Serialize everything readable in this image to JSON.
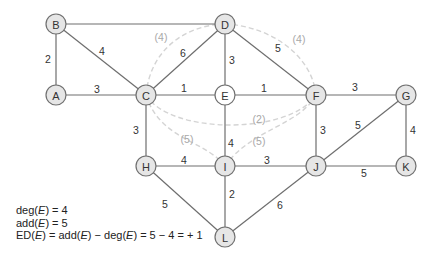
{
  "graph": {
    "nodes": [
      {
        "id": "A",
        "label": "A",
        "x": 56,
        "y": 95,
        "fill": "#e6e6e6"
      },
      {
        "id": "B",
        "label": "B",
        "x": 56,
        "y": 24,
        "fill": "#e6e6e6"
      },
      {
        "id": "C",
        "label": "C",
        "x": 146,
        "y": 95,
        "fill": "#e6e6e6"
      },
      {
        "id": "D",
        "label": "D",
        "x": 225,
        "y": 24,
        "fill": "#e6e6e6"
      },
      {
        "id": "E",
        "label": "E",
        "x": 225,
        "y": 95,
        "fill": "#ffffff"
      },
      {
        "id": "F",
        "label": "F",
        "x": 316,
        "y": 95,
        "fill": "#e6e6e6"
      },
      {
        "id": "G",
        "label": "G",
        "x": 406,
        "y": 95,
        "fill": "#e6e6e6"
      },
      {
        "id": "H",
        "label": "H",
        "x": 146,
        "y": 166,
        "fill": "#e6e6e6"
      },
      {
        "id": "I",
        "label": "I",
        "x": 225,
        "y": 166,
        "fill": "#e6e6e6"
      },
      {
        "id": "J",
        "label": "J",
        "x": 316,
        "y": 166,
        "fill": "#e6e6e6"
      },
      {
        "id": "K",
        "label": "K",
        "x": 406,
        "y": 166,
        "fill": "#e6e6e6"
      },
      {
        "id": "L",
        "label": "L",
        "x": 225,
        "y": 237,
        "fill": "#e6e6e6"
      }
    ],
    "edges": [
      {
        "from": "A",
        "to": "B",
        "weight": "2",
        "lx": 48,
        "ly": 59
      },
      {
        "from": "B",
        "to": "D",
        "weight": "",
        "lx": 0,
        "ly": 0
      },
      {
        "from": "B",
        "to": "C",
        "weight": "4",
        "lx": 102,
        "ly": 51
      },
      {
        "from": "A",
        "to": "C",
        "weight": "3",
        "lx": 97,
        "ly": 89
      },
      {
        "from": "C",
        "to": "D",
        "weight": "6",
        "lx": 183,
        "ly": 53
      },
      {
        "from": "C",
        "to": "E",
        "weight": "1",
        "lx": 184,
        "ly": 88
      },
      {
        "from": "D",
        "to": "E",
        "weight": "3",
        "lx": 232,
        "ly": 60
      },
      {
        "from": "D",
        "to": "F",
        "weight": "5",
        "lx": 278,
        "ly": 48
      },
      {
        "from": "E",
        "to": "F",
        "weight": "1",
        "lx": 264,
        "ly": 88
      },
      {
        "from": "F",
        "to": "G",
        "weight": "3",
        "lx": 355,
        "ly": 87
      },
      {
        "from": "C",
        "to": "H",
        "weight": "3",
        "lx": 136,
        "ly": 130
      },
      {
        "from": "E",
        "to": "I",
        "weight": "4",
        "lx": 231,
        "ly": 143
      },
      {
        "from": "F",
        "to": "J",
        "weight": "3",
        "lx": 323,
        "ly": 130
      },
      {
        "from": "G",
        "to": "J",
        "weight": "5",
        "lx": 358,
        "ly": 125
      },
      {
        "from": "G",
        "to": "K",
        "weight": "4",
        "lx": 413,
        "ly": 130
      },
      {
        "from": "H",
        "to": "I",
        "weight": "4",
        "lx": 184,
        "ly": 160
      },
      {
        "from": "I",
        "to": "J",
        "weight": "3",
        "lx": 267,
        "ly": 160
      },
      {
        "from": "J",
        "to": "K",
        "weight": "5",
        "lx": 364,
        "ly": 173
      },
      {
        "from": "H",
        "to": "L",
        "weight": "5",
        "lx": 165,
        "ly": 204
      },
      {
        "from": "I",
        "to": "L",
        "weight": "2",
        "lx": 232,
        "ly": 194
      },
      {
        "from": "J",
        "to": "L",
        "weight": "6",
        "lx": 280,
        "ly": 205
      }
    ],
    "added_edges": [
      {
        "between": "C-D arc (through B side)",
        "label": "(4)",
        "lx": 161,
        "ly": 37
      },
      {
        "between": "D-F",
        "label": "(4)",
        "lx": 299,
        "ly": 39
      },
      {
        "between": "C-F",
        "label": "(2)",
        "lx": 259,
        "ly": 119
      },
      {
        "between": "C-I",
        "label": "(5)",
        "lx": 187,
        "ly": 139
      },
      {
        "between": "I-F",
        "label": "(5)",
        "lx": 259,
        "ly": 141
      }
    ]
  },
  "notes": {
    "line1_prefix": "deg(",
    "line1_var": "E",
    "line1_suffix": ") = 4",
    "line2_prefix": "add(",
    "line2_var": "E",
    "line2_suffix": ") = 5",
    "line3_a": "ED(",
    "line3_var1": "E",
    "line3_b": ") = add(",
    "line3_var2": "E",
    "line3_c": ") − deg(",
    "line3_var3": "E",
    "line3_d": ") = 5 − 4 = + 1"
  }
}
